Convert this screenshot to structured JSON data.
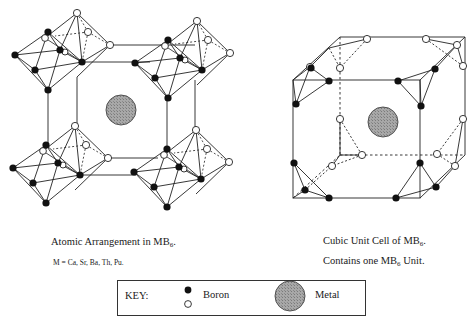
{
  "left_figure": {
    "caption": "Atomic Arrangement in MB",
    "caption_sub": "6",
    "caption_tail": ".",
    "note": "M = Ca, Sr, Ba, Th, Pu."
  },
  "right_figure": {
    "caption_line1": "Cubic Unit Cell of MB",
    "caption_line1_sub": "6",
    "caption_line1_tail": ".",
    "caption_line2_pre": "Contains one MB",
    "caption_line2_sub": "6",
    "caption_line2_tail": " Unit."
  },
  "key": {
    "label": "KEY:",
    "boron_label": "Boron",
    "metal_label": "Metal"
  },
  "colors": {
    "boron_filled": "#111111",
    "boron_open": "#ffffff",
    "metal": "#9a9a9a",
    "line": "#222222"
  }
}
